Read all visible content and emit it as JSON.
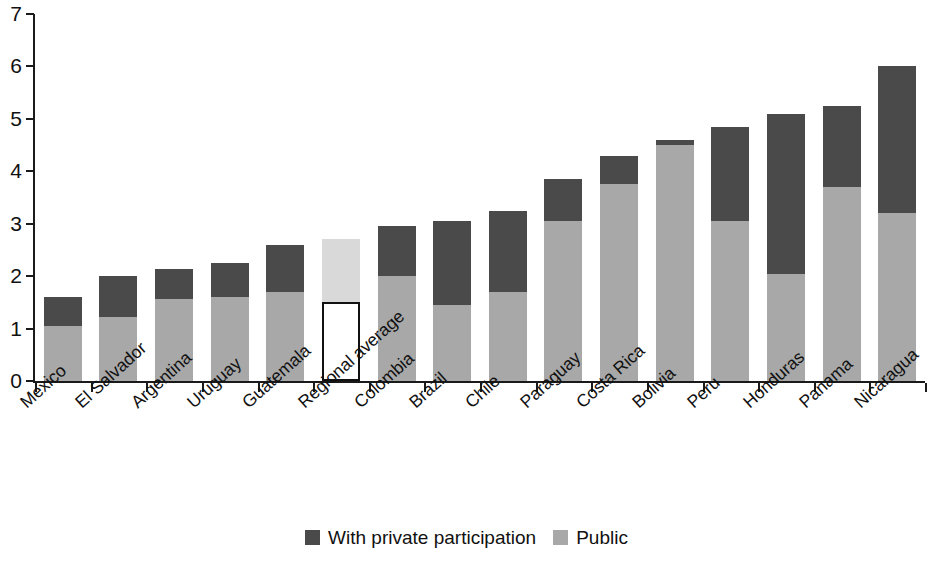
{
  "chart_data": {
    "type": "bar",
    "subtype": "stacked",
    "title": "",
    "xlabel": "",
    "ylabel": "",
    "ylim": [
      0,
      7
    ],
    "ytick_labels": [
      "0",
      "1",
      "2",
      "3",
      "4",
      "5",
      "6",
      "7"
    ],
    "ytick_values": [
      0,
      1,
      2,
      3,
      4,
      5,
      6,
      7
    ],
    "grid": false,
    "legend_position": "bottom",
    "categories": [
      "Mexico",
      "El Salvador",
      "Argentina",
      "Uruguay",
      "Guatemala",
      "Regional average",
      "Colombia",
      "Brazil",
      "Chile",
      "Paraguay",
      "Costa Rica",
      "Bolivia",
      "Peru",
      "Honduras",
      "Panama",
      "Nicaragua"
    ],
    "series": [
      {
        "name": "Public",
        "color": "#a8a8a8",
        "values": [
          1.05,
          1.22,
          1.57,
          1.6,
          1.7,
          1.5,
          2.0,
          1.45,
          1.7,
          3.05,
          3.75,
          4.5,
          3.05,
          2.05,
          3.7,
          3.2
        ]
      },
      {
        "name": "With private participation",
        "color": "#4a4a4a",
        "values": [
          0.55,
          0.78,
          0.56,
          0.65,
          0.9,
          1.2,
          0.95,
          1.6,
          1.55,
          0.8,
          0.55,
          0.1,
          1.8,
          3.05,
          1.55,
          2.8
        ]
      }
    ],
    "totals": [
      1.6,
      2.0,
      2.13,
      2.25,
      2.6,
      2.7,
      2.95,
      3.05,
      3.25,
      3.85,
      4.3,
      4.6,
      4.85,
      5.1,
      5.25,
      6.0
    ],
    "highlight_index": 5,
    "highlight_style": {
      "lower_fill": "#ffffff",
      "lower_border": "#111111",
      "upper_fill": "#d9d9d9"
    }
  },
  "legend": {
    "items": [
      {
        "label": "With private participation",
        "color": "#4a4a4a",
        "swatch": "private-swatch"
      },
      {
        "label": "Public",
        "color": "#a8a8a8",
        "swatch": "public-swatch"
      }
    ]
  },
  "colors": {
    "private": "#4a4a4a",
    "public": "#a8a8a8",
    "regional_average_upper": "#d9d9d9",
    "axis": "#1a1a1a",
    "background": "#ffffff"
  }
}
